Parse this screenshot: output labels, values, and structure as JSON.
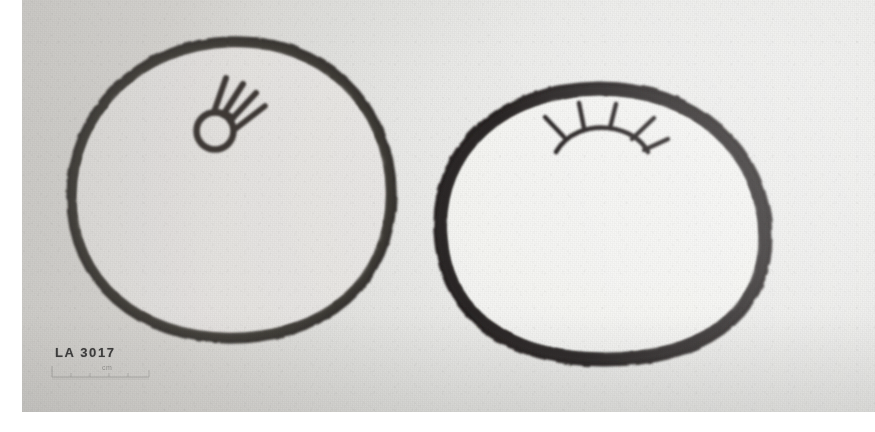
{
  "photograph": {
    "title": "LA 3017 — two circular motif drawings",
    "medium": "black-and-white archive print",
    "border_color": "#ffffff",
    "paper_color": "#ebebe8",
    "ink_color": "#2b2a28"
  },
  "catalog": {
    "label": "LA 3017",
    "scale_caption": "cm"
  },
  "figures": [
    {
      "id": "left-circle",
      "name": "Left circular design",
      "outline_shape": "hand-drawn circle",
      "outline_color": "#332f2c",
      "interior_color": "#e9e8e5",
      "motif": {
        "name": "comet-with-rays",
        "description": "small open circle with four rays fanning to the upper right",
        "ray_count": 4,
        "position": "upper-center"
      }
    },
    {
      "id": "right-circle",
      "name": "Right circular design",
      "outline_shape": "hand-drawn oval",
      "outline_color": "#2b2724",
      "interior_color": "#f4f3f1",
      "motif": {
        "name": "sunburst-rake",
        "description": "arc with four radiating rays, rising-sun motif",
        "ray_count": 4,
        "position": "top-center"
      }
    }
  ]
}
